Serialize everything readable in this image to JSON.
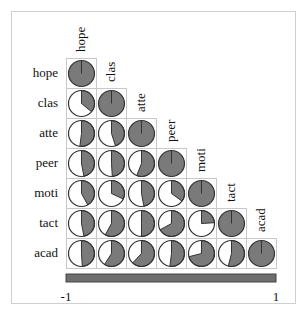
{
  "chart_data": {
    "type": "heatmap",
    "subtype": "correlogram-pie-lower",
    "title": "",
    "variables": [
      "hope",
      "clas",
      "atte",
      "peer",
      "moti",
      "tact",
      "acad"
    ],
    "matrix_lower": [
      [
        1.0
      ],
      [
        0.36,
        1.0
      ],
      [
        0.52,
        0.45,
        1.0
      ],
      [
        0.47,
        0.49,
        0.56,
        1.0
      ],
      [
        0.42,
        0.32,
        0.47,
        0.35,
        1.0
      ],
      [
        0.47,
        0.58,
        0.5,
        0.67,
        0.24,
        1.0
      ],
      [
        0.49,
        0.59,
        0.62,
        0.52,
        0.71,
        0.54,
        1.0
      ]
    ],
    "colorbar": {
      "min": -1,
      "max": 1,
      "tick_labels": [
        "-1",
        "1"
      ],
      "placement": "bottom"
    },
    "colors": {
      "fill": "#7a7a7a",
      "outline": "#333333",
      "grid": "#c8c8c8",
      "colorbar": "#6e6e6e"
    }
  }
}
